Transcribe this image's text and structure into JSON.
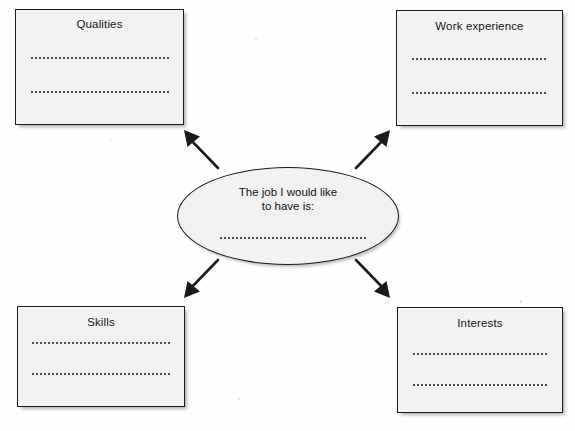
{
  "worksheet": {
    "center": {
      "prompt": "The job I would like\nto have is:",
      "answer_line": "",
      "shape": "ellipse"
    },
    "boxes": [
      {
        "id": "qualities",
        "title": "Qualities",
        "position": "top-left",
        "lines": [
          "",
          ""
        ]
      },
      {
        "id": "work",
        "title": "Work experience",
        "position": "top-right",
        "lines": [
          "",
          ""
        ]
      },
      {
        "id": "skills",
        "title": "Skills",
        "position": "bottom-left",
        "lines": [
          "",
          ""
        ]
      },
      {
        "id": "interests",
        "title": "Interests",
        "position": "bottom-right",
        "lines": [
          "",
          ""
        ]
      }
    ],
    "arrows": [
      {
        "id": "arrow-up-left",
        "direction": "up-left",
        "from": "center",
        "to": "qualities"
      },
      {
        "id": "arrow-up-right",
        "direction": "up-right",
        "from": "center",
        "to": "work"
      },
      {
        "id": "arrow-down-left",
        "direction": "down-left",
        "from": "center",
        "to": "skills"
      },
      {
        "id": "arrow-down-right",
        "direction": "down-right",
        "from": "center",
        "to": "interests"
      }
    ],
    "colors": {
      "page_background": "#fefefe",
      "box_fill": "#f2f2f2",
      "ellipse_fill": "#f1f1f1",
      "stroke": "#1a1a1a",
      "dot_line": "#4a4a4a"
    }
  }
}
